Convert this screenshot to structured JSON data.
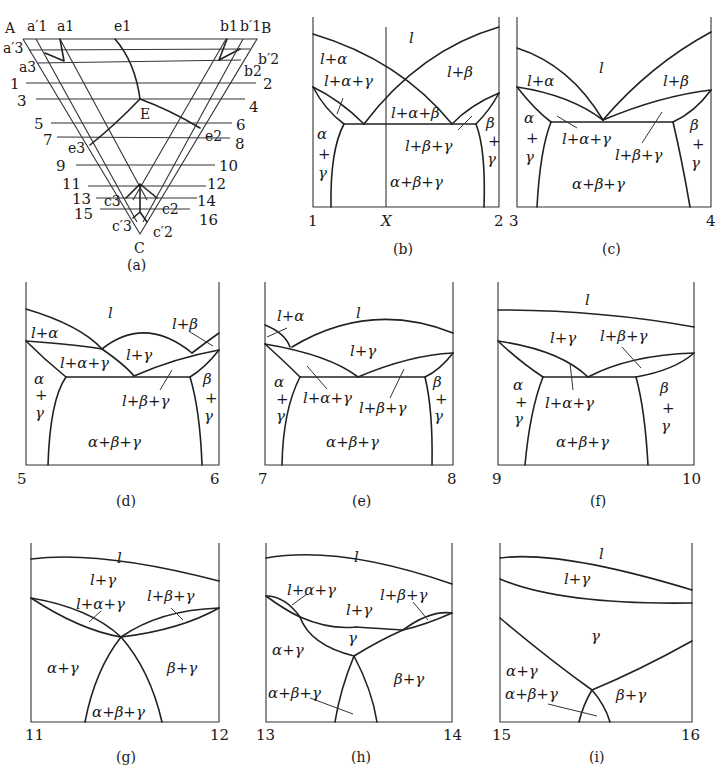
{
  "figure": {
    "ink_color": "#222222",
    "background": "#ffffff",
    "panels": {
      "a": {
        "caption": "(a)",
        "vertices": {
          "A": "A",
          "B": "B",
          "C": "C",
          "E": "E"
        },
        "points": {
          "a1p": "a′1",
          "a1": "a1",
          "e1": "e1",
          "b1": "b1",
          "b1p": "b′1",
          "a3p": "a′3",
          "a3": "a3",
          "b2p": "b′2",
          "b2": "b2",
          "e2": "e2",
          "e3": "e3",
          "c3": "c3",
          "c2": "c2",
          "c3p": "c′3",
          "c2p": "c′2"
        },
        "section_lines": [
          {
            "left": "1",
            "right": "2"
          },
          {
            "left": "3",
            "right": "4"
          },
          {
            "left": "5",
            "right": "6"
          },
          {
            "left": "7",
            "right": "8"
          },
          {
            "left": "9",
            "right": "10"
          },
          {
            "left": "11",
            "right": "12"
          },
          {
            "left": "13",
            "right": "14"
          },
          {
            "left": "15",
            "right": "16"
          }
        ]
      },
      "b": {
        "caption": "(b)",
        "left": "1",
        "mid": "X",
        "right": "2",
        "regions": [
          "l",
          "l+α",
          "l+α+γ",
          "l+β",
          "l+α+β",
          "l+β+γ",
          "α",
          "+",
          "γ",
          "β",
          "+",
          "γ",
          "α+β+γ"
        ]
      },
      "c": {
        "caption": "(c)",
        "left": "3",
        "right": "4",
        "regions": [
          "l",
          "l+α",
          "l+β",
          "l+α+γ",
          "l+β+γ",
          "α",
          "+",
          "γ",
          "β",
          "+",
          "γ",
          "α+β+γ"
        ]
      },
      "d": {
        "caption": "(d)",
        "left": "5",
        "right": "6",
        "regions": [
          "l",
          "l+α",
          "l+β",
          "l+γ",
          "l+α+γ",
          "l+β+γ",
          "α",
          "+",
          "γ",
          "β",
          "+",
          "γ",
          "α+β+γ"
        ]
      },
      "e": {
        "caption": "(e)",
        "left": "7",
        "right": "8",
        "regions": [
          "l",
          "l+α",
          "l+γ",
          "l+α+γ",
          "l+β+γ",
          "α",
          "+",
          "γ",
          "β",
          "+",
          "γ",
          "α+β+γ"
        ]
      },
      "f": {
        "caption": "(f)",
        "left": "9",
        "right": "10",
        "regions": [
          "l",
          "l+γ",
          "l+β+γ",
          "l+α+γ",
          "α",
          "+",
          "γ",
          "β",
          "+",
          "γ",
          "α+β+γ"
        ]
      },
      "g": {
        "caption": "(g)",
        "left": "11",
        "right": "12",
        "regions": [
          "l",
          "l+γ",
          "l+α+γ",
          "l+β+γ",
          "α+γ",
          "β+γ",
          "α+β+γ"
        ]
      },
      "h": {
        "caption": "(h)",
        "left": "13",
        "right": "14",
        "regions": [
          "l",
          "l+α+γ",
          "l+γ",
          "l+β+γ",
          "γ",
          "α+γ",
          "β+γ",
          "α+β+γ"
        ]
      },
      "i": {
        "caption": "(i)",
        "left": "15",
        "right": "16",
        "regions": [
          "l",
          "l+γ",
          "γ",
          "α+γ",
          "α+β+γ",
          "β+γ"
        ]
      }
    }
  }
}
